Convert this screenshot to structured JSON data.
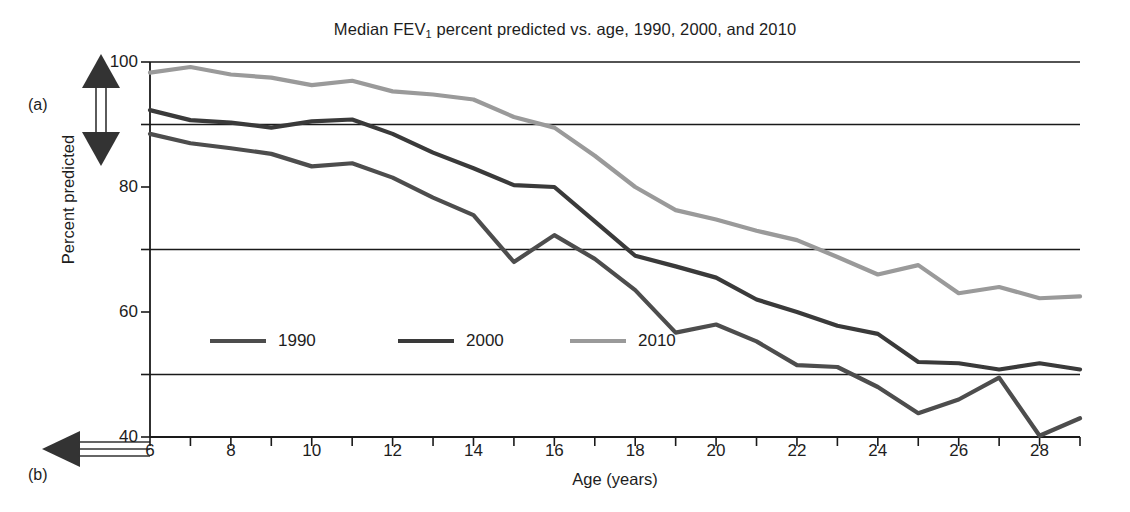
{
  "figure": {
    "panel_labels": [
      {
        "name": "a",
        "text": "(a)",
        "arrow": "vertical-double-arrow"
      },
      {
        "name": "b",
        "text": "(b)",
        "arrow": "horizontal-left-arrow"
      }
    ]
  },
  "chart_data": {
    "type": "line",
    "title": "Median FEV1 percent predicted vs. age, 1990, 2000, and 2010",
    "title_prefix": "Median FEV",
    "title_sub": "1",
    "title_suffix": " percent predicted vs. age, 1990, 2000, and 2010",
    "xlabel": "Age (years)",
    "ylabel": "Percent predicted",
    "xlim": [
      6,
      29
    ],
    "ylim": [
      40,
      100
    ],
    "grid": "horizontal",
    "gridlines": [
      50,
      70,
      90,
      100
    ],
    "y_major_ticks": [
      40,
      60,
      80,
      100
    ],
    "y_minor_ticks": [
      50,
      70,
      90
    ],
    "ytick_labels": [
      "40",
      "60",
      "80",
      "100"
    ],
    "x_ticks": [
      6,
      7,
      8,
      9,
      10,
      11,
      12,
      13,
      14,
      15,
      16,
      17,
      18,
      19,
      20,
      21,
      22,
      23,
      24,
      25,
      26,
      27,
      28,
      29
    ],
    "xtick_labels": [
      "6",
      "8",
      "10",
      "12",
      "14",
      "16",
      "18",
      "20",
      "22",
      "24",
      "26",
      "28"
    ],
    "xtick_label_values": [
      6,
      8,
      10,
      12,
      14,
      16,
      18,
      20,
      22,
      24,
      26,
      28
    ],
    "legend_position": "inside-lower-left",
    "x": [
      6,
      7,
      8,
      9,
      10,
      11,
      12,
      13,
      14,
      15,
      16,
      17,
      18,
      19,
      20,
      21,
      22,
      23,
      24,
      25,
      26,
      27,
      28,
      29
    ],
    "series": [
      {
        "name": "1990",
        "color": "#4d4d4d",
        "values": [
          88.5,
          87.0,
          86.2,
          85.3,
          83.3,
          83.8,
          81.5,
          78.3,
          75.5,
          68.0,
          72.3,
          68.5,
          63.5,
          56.7,
          58.0,
          55.3,
          51.5,
          51.2,
          48.0,
          43.8,
          46.0,
          49.5,
          40.2,
          43.0
        ]
      },
      {
        "name": "2000",
        "color": "#3a3a3a",
        "values": [
          92.3,
          90.7,
          90.3,
          89.5,
          90.5,
          90.8,
          88.5,
          85.5,
          83.0,
          80.3,
          80.0,
          74.5,
          69.0,
          67.3,
          65.5,
          62.0,
          60.0,
          57.8,
          56.5,
          52.0,
          51.8,
          50.8,
          51.8,
          50.8
        ]
      },
      {
        "name": "2010",
        "color": "#9a9a9a",
        "values": [
          98.3,
          99.2,
          98.0,
          97.5,
          96.3,
          97.0,
          95.3,
          94.8,
          94.0,
          91.2,
          89.5,
          85.0,
          80.0,
          76.3,
          74.8,
          73.0,
          71.5,
          68.8,
          66.0,
          67.5,
          63.0,
          64.0,
          62.2,
          62.5
        ]
      }
    ],
    "legend": [
      {
        "label": "1990",
        "color": "#4d4d4d"
      },
      {
        "label": "2000",
        "color": "#3a3a3a"
      },
      {
        "label": "2010",
        "color": "#9a9a9a"
      }
    ]
  }
}
